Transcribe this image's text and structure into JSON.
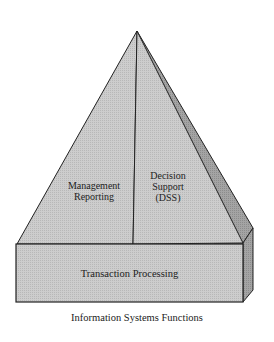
{
  "diagram": {
    "title": "Information Systems Functions",
    "apex_label": "",
    "faces": [
      {
        "name": "management-reporting",
        "lines": [
          "Management",
          "Reporting"
        ]
      },
      {
        "name": "decision-support",
        "lines": [
          "Decision",
          "Support",
          "(DSS)"
        ]
      }
    ],
    "base": {
      "label": "Transaction Processing"
    },
    "colors": {
      "face": "#c9c9c9",
      "side": "#9a9a9a",
      "stroke": "#222222",
      "background": "#ffffff"
    }
  }
}
